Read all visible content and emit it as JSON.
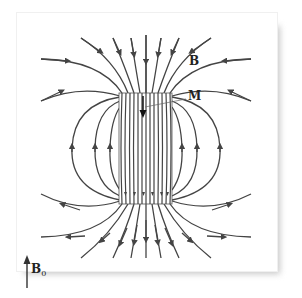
{
  "diagram": {
    "type": "magnetic field lines of a uniformly magnetized cylinder in external field",
    "labels": {
      "field": "B",
      "magnetization": "M",
      "external_field": "B",
      "external_field_sub": "0"
    },
    "elements": {
      "cylinder": "rectangle with internal dense downward field lines",
      "magnetization_arrow": "downward",
      "external_field_arrow": "upward",
      "outer_lines": "enter from top converging into cylinder, exit bottom fanning out",
      "return_loops": "side loops pointing upward, 3 per side"
    },
    "colors": {
      "line": "#444444",
      "background": "#ffffff",
      "shadow": "#c8c8c8"
    }
  }
}
